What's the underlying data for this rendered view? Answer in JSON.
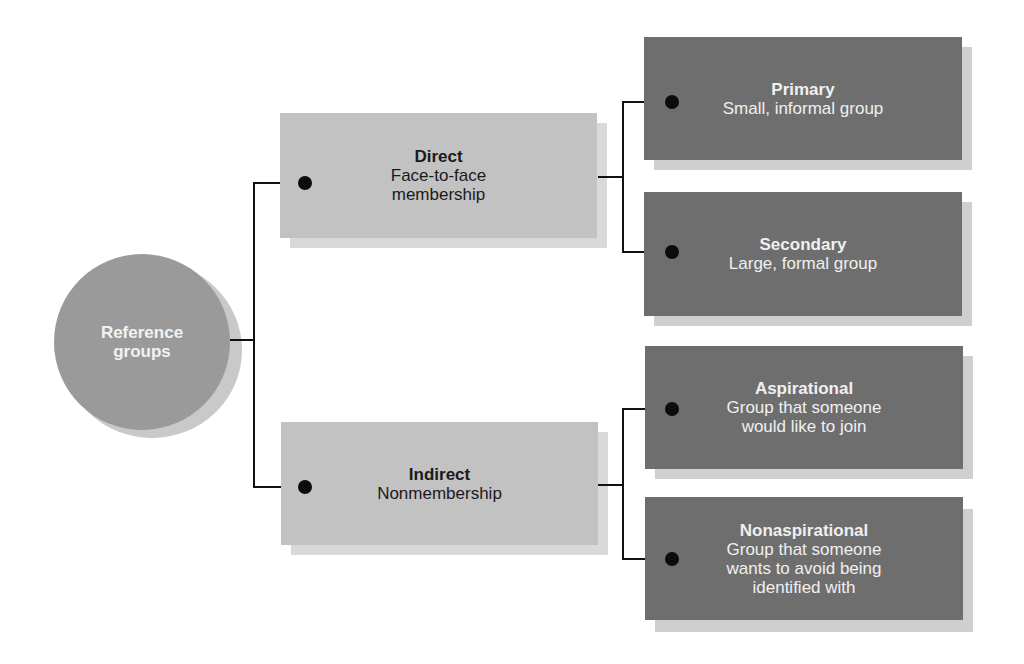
{
  "diagram": {
    "root": {
      "label_line1": "Reference",
      "label_line2": "groups"
    },
    "branches": [
      {
        "title": "Direct",
        "desc_line1": "Face-to-face",
        "desc_line2": "membership",
        "children": [
          {
            "title": "Primary",
            "desc_line1": "Small, informal group"
          },
          {
            "title": "Secondary",
            "desc_line1": "Large, formal group"
          }
        ]
      },
      {
        "title": "Indirect",
        "desc_line1": "Nonmembership",
        "children": [
          {
            "title": "Aspirational",
            "desc_line1": "Group that someone",
            "desc_line2": "would like to join"
          },
          {
            "title": "Nonaspirational",
            "desc_line1": "Group that someone",
            "desc_line2": "wants to avoid being",
            "desc_line3": "identified with"
          }
        ]
      }
    ],
    "colors": {
      "root_fill": "#9a9a9a",
      "level1_fill": "#c2c2c2",
      "level2_fill": "#6e6e6e",
      "connector": "#111111"
    }
  }
}
